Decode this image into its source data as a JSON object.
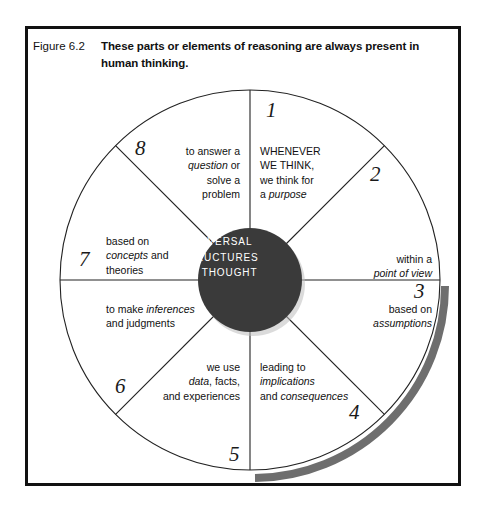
{
  "figure": {
    "label": "Figure 6.2",
    "caption": "These parts or elements of reasoning are always present in human thinking."
  },
  "wheel": {
    "hub_text": "UNIVERSAL\nSTRUCTURES\nOF THOUGHT",
    "hub_color": "#3a3a3a",
    "outline_color": "#222222",
    "shadow_color": "#6e6e6e",
    "segments": [
      {
        "number": "1",
        "text": "WHENEVER\nWE THINK,\nwe think for\na purpose",
        "align": "left"
      },
      {
        "number": "2",
        "text": "within a\npoint of view",
        "align": "right"
      },
      {
        "number": "3",
        "text": "based on\nassumptions",
        "align": "right"
      },
      {
        "number": "4",
        "text": "leading to\nimplications\nand consequences",
        "align": "left"
      },
      {
        "number": "5",
        "text": "we use\ndata, facts,\nand experiences",
        "align": "right"
      },
      {
        "number": "6",
        "text": "to make inferences\nand judgments",
        "align": "left"
      },
      {
        "number": "7",
        "text": "based on\nconcepts and\ntheories",
        "align": "left"
      },
      {
        "number": "8",
        "text": "to answer a\nquestion or\nsolve a\nproblem",
        "align": "right"
      }
    ]
  },
  "footnote": {
    "text": ""
  }
}
